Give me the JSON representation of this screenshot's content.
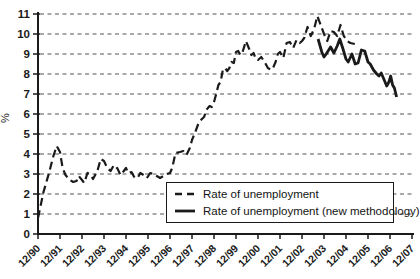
{
  "chart_data": {
    "type": "line",
    "title": "",
    "ylabel": "%",
    "ylim": [
      0,
      11
    ],
    "yticks": [
      0,
      1,
      2,
      3,
      4,
      5,
      6,
      7,
      8,
      9,
      10,
      11
    ],
    "x_unit": "years since Dec 1990",
    "xticklabels": [
      "12/90",
      "12/91",
      "12/92",
      "12/93",
      "12/94",
      "12/95",
      "12/96",
      "12/97",
      "12/98",
      "12/99",
      "12/00",
      "12/01",
      "12/02",
      "12/03",
      "12/04",
      "12/05",
      "12/06",
      "12/07"
    ],
    "grid": "horizontal dashed",
    "legend_position": "inside bottom center",
    "series": [
      {
        "name": "Rate of unemployment",
        "line_style": "dashed",
        "color": "#1a1a1a",
        "points": [
          [
            0,
            0.8
          ],
          [
            0.25,
            2.1
          ],
          [
            0.5,
            3.05
          ],
          [
            0.7,
            3.9
          ],
          [
            0.85,
            4.4
          ],
          [
            1.0,
            4.1
          ],
          [
            1.12,
            3.3
          ],
          [
            1.25,
            2.95
          ],
          [
            1.45,
            2.7
          ],
          [
            1.6,
            2.6
          ],
          [
            1.75,
            2.65
          ],
          [
            1.85,
            2.9
          ],
          [
            2.0,
            2.7
          ],
          [
            2.1,
            2.55
          ],
          [
            2.25,
            3.05
          ],
          [
            2.4,
            2.95
          ],
          [
            2.5,
            2.75
          ],
          [
            2.7,
            3.15
          ],
          [
            2.85,
            3.75
          ],
          [
            3.0,
            3.65
          ],
          [
            3.15,
            3.3
          ],
          [
            3.3,
            3.15
          ],
          [
            3.4,
            3.35
          ],
          [
            3.5,
            3.2
          ],
          [
            3.6,
            3.3
          ],
          [
            3.75,
            2.95
          ],
          [
            3.9,
            3.15
          ],
          [
            4.0,
            3.3
          ],
          [
            4.1,
            3.05
          ],
          [
            4.25,
            3.1
          ],
          [
            4.4,
            2.8
          ],
          [
            4.55,
            2.85
          ],
          [
            4.65,
            3.05
          ],
          [
            4.8,
            2.95
          ],
          [
            4.95,
            2.8
          ],
          [
            5.1,
            3.05
          ],
          [
            5.25,
            3.0
          ],
          [
            5.4,
            2.9
          ],
          [
            5.55,
            2.8
          ],
          [
            5.7,
            2.9
          ],
          [
            5.85,
            3.0
          ],
          [
            6.0,
            3.05
          ],
          [
            6.1,
            3.3
          ],
          [
            6.25,
            4.05
          ],
          [
            6.45,
            4.1
          ],
          [
            6.6,
            4.15
          ],
          [
            6.75,
            3.95
          ],
          [
            6.9,
            4.3
          ],
          [
            7.0,
            4.7
          ],
          [
            7.15,
            5.1
          ],
          [
            7.3,
            5.55
          ],
          [
            7.45,
            5.75
          ],
          [
            7.55,
            5.85
          ],
          [
            7.65,
            6.2
          ],
          [
            7.8,
            6.4
          ],
          [
            7.9,
            6.35
          ],
          [
            8.0,
            6.6
          ],
          [
            8.1,
            7.0
          ],
          [
            8.2,
            7.45
          ],
          [
            8.3,
            7.6
          ],
          [
            8.4,
            8.2
          ],
          [
            8.5,
            8.3
          ],
          [
            8.6,
            8.15
          ],
          [
            8.7,
            8.3
          ],
          [
            8.8,
            8.6
          ],
          [
            8.9,
            8.55
          ],
          [
            9.0,
            9.1
          ],
          [
            9.1,
            9.15
          ],
          [
            9.2,
            8.95
          ],
          [
            9.3,
            9.1
          ],
          [
            9.45,
            9.65
          ],
          [
            9.6,
            9.25
          ],
          [
            9.7,
            8.95
          ],
          [
            9.8,
            9.05
          ],
          [
            9.9,
            8.75
          ],
          [
            10.0,
            8.7
          ],
          [
            10.15,
            8.85
          ],
          [
            10.3,
            8.6
          ],
          [
            10.45,
            8.3
          ],
          [
            10.6,
            8.2
          ],
          [
            10.7,
            8.35
          ],
          [
            10.8,
            8.6
          ],
          [
            10.9,
            9.0
          ],
          [
            11.0,
            9.1
          ],
          [
            11.15,
            8.8
          ],
          [
            11.3,
            9.55
          ],
          [
            11.45,
            9.6
          ],
          [
            11.6,
            9.3
          ],
          [
            11.75,
            9.7
          ],
          [
            11.9,
            9.55
          ],
          [
            12.0,
            9.65
          ],
          [
            12.1,
            9.8
          ],
          [
            12.25,
            10.35
          ],
          [
            12.4,
            9.9
          ],
          [
            12.55,
            10.25
          ],
          [
            12.7,
            10.9
          ],
          [
            12.85,
            10.45
          ],
          [
            13.0,
            10.0
          ],
          [
            13.15,
            9.65
          ],
          [
            13.3,
            10.15
          ],
          [
            13.45,
            10.1
          ],
          [
            13.6,
            9.9
          ],
          [
            13.75,
            10.45
          ],
          [
            13.9,
            9.9
          ],
          [
            14.05,
            9.65
          ],
          [
            14.2,
            9.55
          ],
          [
            14.4,
            9.5
          ]
        ]
      },
      {
        "name": "Rate of unemployment (new methodology)",
        "line_style": "solid",
        "color": "#1a1a1a",
        "points": [
          [
            12.73,
            9.75
          ],
          [
            12.9,
            9.1
          ],
          [
            13.0,
            8.85
          ],
          [
            13.1,
            9.0
          ],
          [
            13.3,
            9.35
          ],
          [
            13.45,
            9.05
          ],
          [
            13.6,
            9.4
          ],
          [
            13.72,
            9.75
          ],
          [
            13.85,
            9.3
          ],
          [
            14.0,
            8.75
          ],
          [
            14.1,
            8.6
          ],
          [
            14.27,
            9.0
          ],
          [
            14.42,
            8.5
          ],
          [
            14.55,
            8.55
          ],
          [
            14.7,
            9.2
          ],
          [
            14.85,
            9.15
          ],
          [
            15.0,
            8.6
          ],
          [
            15.1,
            8.5
          ],
          [
            15.25,
            8.2
          ],
          [
            15.4,
            8.0
          ],
          [
            15.5,
            7.9
          ],
          [
            15.6,
            8.05
          ],
          [
            15.72,
            7.75
          ],
          [
            15.85,
            7.4
          ],
          [
            15.95,
            7.6
          ],
          [
            16.03,
            7.9
          ],
          [
            16.12,
            7.45
          ],
          [
            16.2,
            7.3
          ],
          [
            16.3,
            6.85
          ]
        ]
      }
    ]
  },
  "colors": {
    "axis": "#1a1a1a",
    "grid": "#555555",
    "background": "#ffffff"
  }
}
